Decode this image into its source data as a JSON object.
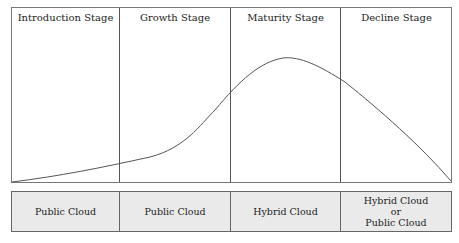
{
  "stages": [
    {
      "label": "Introduction Stage"
    },
    {
      "label": "Growth Stage"
    },
    {
      "label": "Maturity Stage"
    },
    {
      "label": "Decline Stage"
    }
  ],
  "cloud_types": [
    {
      "label": "Public Cloud"
    },
    {
      "label": "Public Cloud"
    },
    {
      "label": "Hybrid Cloud"
    },
    {
      "label": "Hybrid Cloud\nor\nPublic Cloud"
    }
  ],
  "colors": {
    "curve": "#555555",
    "border": "#666666",
    "bottom_fill": "#eaeaea"
  }
}
